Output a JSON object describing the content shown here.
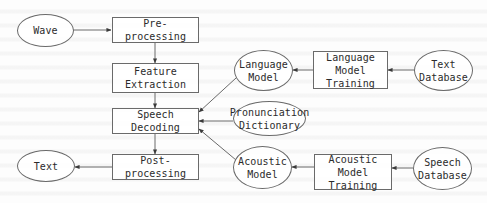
{
  "diagram": {
    "nodes": {
      "wave": {
        "label": "Wave",
        "shape": "ellipse"
      },
      "preprocessing": {
        "label": "Pre-processing",
        "shape": "rect"
      },
      "feature_extraction": {
        "label": "Feature\nExtraction",
        "shape": "rect"
      },
      "speech_decoding": {
        "label": "Speech Decoding",
        "shape": "rect"
      },
      "postprocessing": {
        "label": "Post-processing",
        "shape": "rect"
      },
      "text": {
        "label": "Text",
        "shape": "ellipse"
      },
      "language_model": {
        "label": "Language\nModel",
        "shape": "ellipse"
      },
      "language_model_training": {
        "label": "Language Model\nTraining",
        "shape": "rect"
      },
      "text_database": {
        "label": "Text\nDatabase",
        "shape": "ellipse"
      },
      "pronunciation_dictionary": {
        "label": "Pronunciation\nDictionary",
        "shape": "ellipse"
      },
      "acoustic_model": {
        "label": "Acoustic\nModel",
        "shape": "ellipse"
      },
      "acoustic_model_training": {
        "label": "Acoustic Model\nTraining",
        "shape": "rect"
      },
      "speech_database": {
        "label": "Speech\nDatabase",
        "shape": "ellipse"
      }
    },
    "edges": [
      {
        "from": "Wave",
        "to": "Pre-processing"
      },
      {
        "from": "Pre-processing",
        "to": "Feature Extraction"
      },
      {
        "from": "Feature Extraction",
        "to": "Speech Decoding"
      },
      {
        "from": "Speech Decoding",
        "to": "Post-processing"
      },
      {
        "from": "Post-processing",
        "to": "Text"
      },
      {
        "from": "Text Database",
        "to": "Language Model Training"
      },
      {
        "from": "Language Model Training",
        "to": "Language Model"
      },
      {
        "from": "Language Model",
        "to": "Speech Decoding"
      },
      {
        "from": "Pronunciation Dictionary",
        "to": "Speech Decoding"
      },
      {
        "from": "Speech Database",
        "to": "Acoustic Model Training"
      },
      {
        "from": "Acoustic Model Training",
        "to": "Acoustic Model"
      },
      {
        "from": "Acoustic Model",
        "to": "Speech Decoding"
      }
    ],
    "colors": {
      "stroke": "#6a6a6a",
      "text": "#2b2b2b",
      "background": "#fdfdfd"
    }
  }
}
